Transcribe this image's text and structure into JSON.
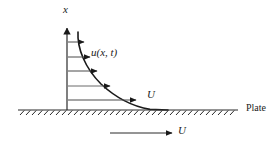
{
  "figure": {
    "type": "boundary-layer-velocity-profile-diagram",
    "background_color": "#ffffff",
    "stroke_color": "#1a1a1a",
    "axis": {
      "vertical_label": "x",
      "origin": [
        67,
        110
      ],
      "top": [
        67,
        28
      ]
    },
    "curve": {
      "label": "u(x, t)",
      "description": "exponentially decaying velocity profile from axis to plate"
    },
    "plate": {
      "label": "Plate",
      "line_y": 110,
      "x_start": 18,
      "x_end": 238,
      "hatch_count": 36,
      "hatch_spacing": 6
    },
    "freestream": {
      "upper_label": "U",
      "lower_label": "U",
      "arrow_start_x": 110,
      "arrow_end_x": 172,
      "arrow_y": 133
    },
    "profile_arrows": [
      {
        "y": 42,
        "x_start": 68,
        "x_end": 84
      },
      {
        "y": 57,
        "x_start": 68,
        "x_end": 90
      },
      {
        "y": 71,
        "x_start": 68,
        "x_end": 97
      },
      {
        "y": 86,
        "x_start": 68,
        "x_end": 110
      },
      {
        "y": 100,
        "x_start": 68,
        "x_end": 136
      }
    ]
  }
}
